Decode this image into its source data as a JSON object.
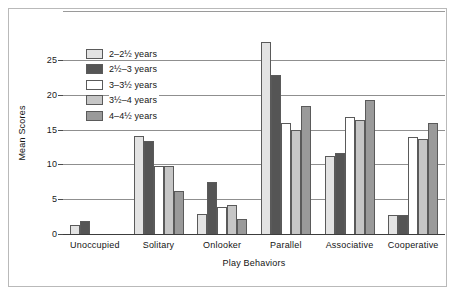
{
  "chart_data": {
    "type": "bar",
    "title": "",
    "xlabel": "Play Behaviors",
    "ylabel": "Mean Scores",
    "ylim": [
      0,
      29
    ],
    "yticks": [
      0,
      5,
      10,
      15,
      20,
      25
    ],
    "ytick_labels": [
      "0",
      "5",
      "10",
      "15",
      "20",
      "25"
    ],
    "grid": true,
    "legend_position": "upper-left-inside",
    "categories": [
      "Unoccupied",
      "Solitary",
      "Onlooker",
      "Parallel",
      "Associative",
      "Cooperative"
    ],
    "series": [
      {
        "name": "2–2½ years",
        "color": "#e3e3e3",
        "values": [
          1.3,
          14.1,
          2.9,
          27.6,
          11.2,
          2.8
        ]
      },
      {
        "name": "2½–3 years",
        "color": "#555555",
        "values": [
          1.8,
          13.3,
          7.4,
          22.9,
          11.6,
          2.7
        ]
      },
      {
        "name": "3–3½ years",
        "color": "#ffffff",
        "values": [
          0.0,
          9.8,
          3.9,
          16.0,
          16.8,
          13.9
        ]
      },
      {
        "name": "3½–4 years",
        "color": "#c6c6c6",
        "values": [
          0.0,
          9.8,
          4.1,
          14.9,
          16.3,
          13.6
        ]
      },
      {
        "name": "4–4½ years",
        "color": "#9a9a9a",
        "values": [
          0.0,
          6.2,
          2.1,
          18.4,
          19.3,
          16.0
        ]
      }
    ]
  }
}
